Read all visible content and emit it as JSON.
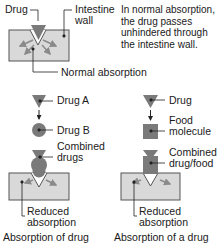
{
  "colors": {
    "wall_fill": "#d9d9d9",
    "wall_stroke": "#555555",
    "drug_fill": "#7a7a7a",
    "arrow_color": "#8a8a8a",
    "line_color": "#222222"
  },
  "normal": {
    "drug_label": "Drug",
    "wall_label": "Intestine wall",
    "wall_label_line1": "Intestine",
    "wall_label_line2": "wall",
    "description_line1": "In normal absorption,",
    "description_line2": "the drug passes",
    "description_line3": "unhindered through",
    "description_line4": "the intestine wall.",
    "absorption_label": "Normal absorption"
  },
  "drug_drug": {
    "drug_a_label": "Drug A",
    "drug_b_label": "Drug B",
    "combined_line1": "Combined",
    "combined_line2": "drugs",
    "reduced_line1": "Reduced",
    "reduced_line2": "absorption",
    "caption": "Absorption of drug"
  },
  "drug_food": {
    "drug_label": "Drug",
    "food_line1": "Food",
    "food_line2": "molecule",
    "combined_line1": "Combined",
    "combined_line2": "drug/food",
    "reduced_line1": "Reduced",
    "reduced_line2": "absorption",
    "caption": "Absorption of a drug"
  }
}
